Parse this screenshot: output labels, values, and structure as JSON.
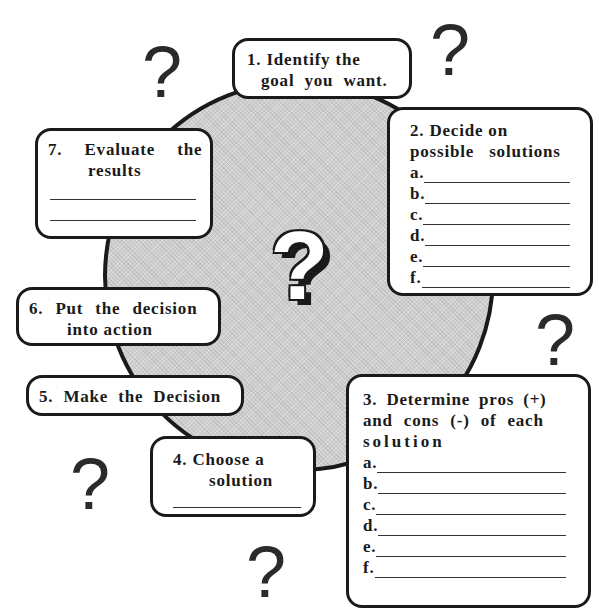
{
  "diagram": {
    "type": "decision-making-cycle",
    "center_symbol": "?",
    "decorative_symbols": [
      "?",
      "?",
      "?",
      "?",
      "?"
    ],
    "steps": [
      {
        "number": "1.",
        "title_line1": "1. Identify the",
        "title_line2": "goal  you  want."
      },
      {
        "number": "2.",
        "title_line1": "2. Decide on",
        "title_line2": "possible   solutions",
        "blanks": [
          "a.",
          "b.",
          "c.",
          "d.",
          "e.",
          "f."
        ]
      },
      {
        "number": "3.",
        "title_line1": "3. Determine pros (+)",
        "title_line2": "and cons (-) of each",
        "title_line3": "solution",
        "blanks": [
          "a.",
          "b.",
          "c.",
          "d.",
          "e.",
          "f."
        ]
      },
      {
        "number": "4.",
        "title_line1": "4. Choose a",
        "title_line2": "solution",
        "blank_lines": 1
      },
      {
        "number": "5.",
        "title_line1": "5. Make the Decision"
      },
      {
        "number": "6.",
        "title_line1": "6. Put the decision",
        "title_line2": "into action"
      },
      {
        "number": "7.",
        "title_line1": "7.  Evaluate  the",
        "title_line2": "results",
        "blank_lines": 2
      }
    ]
  },
  "colors": {
    "ink": "#1a1a1a",
    "circle_fill": "#cfcfcf",
    "box_fill": "#ffffff"
  }
}
